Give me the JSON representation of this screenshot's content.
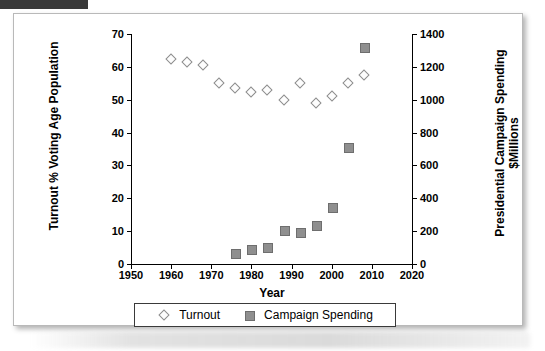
{
  "figure": {
    "x_axis_title": "Year",
    "y_left_title": "Turnout % Voting Age Population",
    "y_right_title": "Presidential Campaign Spending $Millions"
  },
  "legend": {
    "items": [
      {
        "label": "Turnout",
        "marker": "diamond-marker",
        "color": "#fdfdfd"
      },
      {
        "label": "Campaign Spending",
        "marker": "square-marker",
        "color": "#8f8f8f"
      }
    ]
  },
  "chart_data": {
    "type": "scatter",
    "title": "",
    "xlabel": "Year",
    "ylabel": "Turnout % Voting Age Population",
    "y2label": "Presidential Campaign Spending $Millions",
    "xlim": [
      1950,
      2020
    ],
    "ylim": [
      0,
      70
    ],
    "y2lim": [
      0,
      1400
    ],
    "xticks": [
      1950,
      1960,
      1970,
      1980,
      1990,
      2000,
      2010,
      2020
    ],
    "yticks": [
      0,
      10,
      20,
      30,
      40,
      50,
      60,
      70
    ],
    "y2ticks": [
      0,
      200,
      400,
      600,
      800,
      1000,
      1200,
      1400
    ],
    "grid": false,
    "legend_position": "bottom",
    "series": [
      {
        "name": "Turnout",
        "axis": "left",
        "marker": "diamond",
        "x": [
          1960,
          1964,
          1968,
          1972,
          1976,
          1980,
          1984,
          1988,
          1992,
          1996,
          2000,
          2004,
          2008
        ],
        "values": [
          62.5,
          61.5,
          60.5,
          55.0,
          53.5,
          52.5,
          53.0,
          50.0,
          55.0,
          49.0,
          51.0,
          55.0,
          57.5
        ]
      },
      {
        "name": "Campaign Spending",
        "axis": "right",
        "marker": "square",
        "x": [
          1976,
          1980,
          1984,
          1988,
          1992,
          1996,
          2000,
          2004,
          2008
        ],
        "values": [
          66,
          92,
          104,
          210,
          194,
          240,
          345,
          712,
          1320
        ]
      }
    ]
  }
}
